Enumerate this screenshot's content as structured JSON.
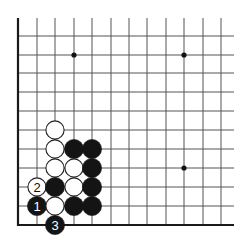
{
  "diagram": {
    "type": "go-board-fragment",
    "colors": {
      "background": "#ffffff",
      "line": "#555555",
      "edge": "#1a1a1a",
      "black_stone": "#141414",
      "white_stone": "#ffffff",
      "stone_outline": "#222222",
      "star_point": "#111111"
    },
    "grid": {
      "columns_x": [
        18,
        37,
        55,
        74,
        92,
        111,
        129,
        147,
        166,
        184,
        203,
        221
      ],
      "rows_y": [
        36,
        55,
        73,
        92,
        111,
        130,
        149,
        168,
        187,
        206,
        225
      ],
      "top_extent": 18,
      "right_extent": 234,
      "left_edge_x": 18,
      "bottom_edge_y": 225
    },
    "star_points": [
      {
        "col": 3,
        "row": 1
      },
      {
        "col": 9,
        "row": 1
      },
      {
        "col": 9,
        "row": 7
      }
    ],
    "stones": [
      {
        "color": "white",
        "col": 2,
        "row": 5,
        "label": ""
      },
      {
        "color": "white",
        "col": 2,
        "row": 6,
        "label": ""
      },
      {
        "color": "black",
        "col": 3,
        "row": 6,
        "label": ""
      },
      {
        "color": "black",
        "col": 4,
        "row": 6,
        "label": ""
      },
      {
        "color": "white",
        "col": 2,
        "row": 7,
        "label": ""
      },
      {
        "color": "white",
        "col": 3,
        "row": 7,
        "label": ""
      },
      {
        "color": "black",
        "col": 4,
        "row": 7,
        "label": ""
      },
      {
        "color": "white",
        "col": 1,
        "row": 8,
        "label": "2"
      },
      {
        "color": "black",
        "col": 2,
        "row": 8,
        "label": ""
      },
      {
        "color": "white",
        "col": 3,
        "row": 8,
        "label": ""
      },
      {
        "color": "black",
        "col": 4,
        "row": 8,
        "label": ""
      },
      {
        "color": "black",
        "col": 1,
        "row": 9,
        "label": "1"
      },
      {
        "color": "white",
        "col": 2,
        "row": 9,
        "label": ""
      },
      {
        "color": "black",
        "col": 3,
        "row": 9,
        "label": ""
      },
      {
        "color": "black",
        "col": 4,
        "row": 9,
        "label": ""
      },
      {
        "color": "black",
        "col": 2,
        "row": 10,
        "label": "3"
      }
    ],
    "move_labels": [
      "1",
      "2",
      "3"
    ]
  }
}
